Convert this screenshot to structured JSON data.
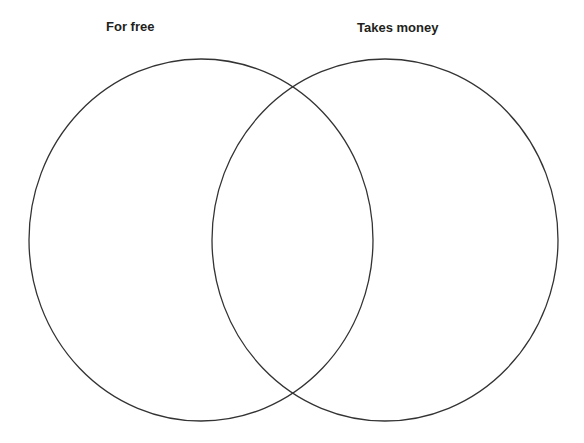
{
  "diagram": {
    "type": "venn",
    "sets": [
      {
        "label": "For free",
        "cx": 201,
        "cy": 240,
        "rx": 172,
        "ry": 181
      },
      {
        "label": "Takes money",
        "cx": 385,
        "cy": 240,
        "rx": 173,
        "ry": 181
      }
    ],
    "stroke_color": "#333333",
    "background": "#ffffff"
  }
}
